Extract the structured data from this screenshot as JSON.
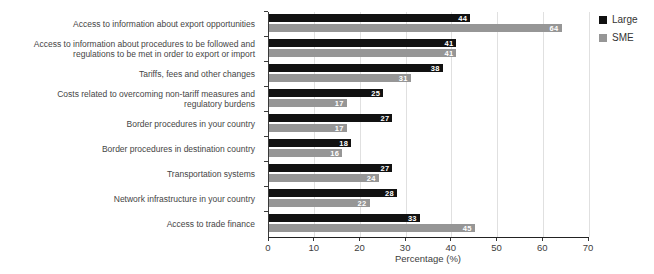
{
  "chart_data": {
    "type": "bar",
    "orientation": "horizontal",
    "title": "",
    "categories": [
      "Access to information about export opportunities",
      "Access to information about procedures to be followed and regulations to be met in order to export or import",
      "Tariffs, fees and other changes",
      "Costs related to overcoming non-tariff measures and regulatory burdens",
      "Border procedures in your country",
      "Border procedures in destination country",
      "Transportation systems",
      "Network infrastructure in your country",
      "Access to trade finance"
    ],
    "series": [
      {
        "name": "Large",
        "color": "#111111",
        "values": [
          44,
          41,
          38,
          25,
          27,
          18,
          27,
          28,
          33
        ]
      },
      {
        "name": "SME",
        "color": "#969696",
        "values": [
          64,
          41,
          31,
          17,
          17,
          16,
          24,
          22,
          45
        ]
      }
    ],
    "xlabel": "Percentage (%)",
    "ylabel": "",
    "xlim": [
      0,
      70
    ],
    "x_ticks": [
      0,
      10,
      20,
      30,
      40,
      50,
      60,
      70
    ],
    "grid": "vertical-light-gray",
    "legend_position": "top-right",
    "value_labels": "white, bold, inside bar end",
    "colors": {
      "background": "#ffffff",
      "gridline": "#e0e0e0",
      "axis_line": "#222222",
      "label_text": "#454545"
    }
  }
}
